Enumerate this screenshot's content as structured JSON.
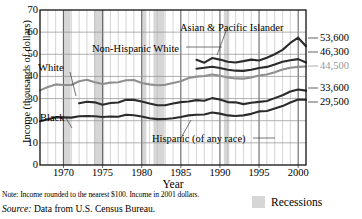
{
  "chart_data": {
    "type": "line",
    "title": "",
    "xlabel": "Year",
    "ylabel": "Income (thousands of dollars)",
    "xlim": [
      1967,
      2001
    ],
    "ylim": [
      0,
      70
    ],
    "yticks": [
      0,
      10,
      20,
      30,
      40,
      50,
      60,
      70
    ],
    "xticks": [
      1970,
      1975,
      1980,
      1985,
      1990,
      1995,
      2000
    ],
    "grid": true,
    "legend_position": "inline-annotations",
    "x": [
      1967,
      1968,
      1969,
      1970,
      1971,
      1972,
      1973,
      1974,
      1975,
      1976,
      1977,
      1978,
      1979,
      1980,
      1981,
      1982,
      1983,
      1984,
      1985,
      1986,
      1987,
      1988,
      1989,
      1990,
      1991,
      1992,
      1993,
      1994,
      1995,
      1996,
      1997,
      1998,
      1999,
      2000,
      2001
    ],
    "series": [
      {
        "name": "Asian & Pacific Islander",
        "color": "#2b2b2b",
        "values": [
          null,
          null,
          null,
          null,
          null,
          null,
          null,
          null,
          null,
          null,
          null,
          null,
          null,
          null,
          null,
          null,
          null,
          null,
          null,
          null,
          47.5,
          46.2,
          48.3,
          47.6,
          46.6,
          46.3,
          46.9,
          47.6,
          47.2,
          48.4,
          50.0,
          52.0,
          55.1,
          57.5,
          53.6
        ]
      },
      {
        "name": "Non-Hispanic White",
        "color": "#2b2b2b",
        "values": [
          null,
          null,
          null,
          null,
          null,
          null,
          null,
          null,
          null,
          null,
          null,
          null,
          null,
          null,
          null,
          null,
          null,
          null,
          null,
          null,
          43.5,
          43.9,
          44.4,
          43.8,
          43.0,
          42.6,
          42.5,
          43.0,
          43.8,
          44.3,
          45.4,
          46.6,
          47.3,
          47.8,
          46.3
        ]
      },
      {
        "name": "White",
        "color": "#8f8f8f",
        "values": [
          33.7,
          35.2,
          36.4,
          36.1,
          36.1,
          37.8,
          38.5,
          37.4,
          36.6,
          37.2,
          37.4,
          38.3,
          38.4,
          37.0,
          36.4,
          36.0,
          36.2,
          37.0,
          37.8,
          39.3,
          39.9,
          40.2,
          40.9,
          40.3,
          39.5,
          39.1,
          39.0,
          39.5,
          40.4,
          40.9,
          41.9,
          43.1,
          43.9,
          44.3,
          44.5
        ]
      },
      {
        "name": "Hispanic (of any race)",
        "color": "#2b2b2b",
        "values": [
          null,
          null,
          null,
          null,
          null,
          27.9,
          28.6,
          28.3,
          27.2,
          28.0,
          28.2,
          29.5,
          29.4,
          28.7,
          27.8,
          27.0,
          27.0,
          27.8,
          28.4,
          28.7,
          29.3,
          29.0,
          30.2,
          29.6,
          28.4,
          28.3,
          27.5,
          28.1,
          28.5,
          28.9,
          30.2,
          31.5,
          33.2,
          34.1,
          33.6
        ]
      },
      {
        "name": "Black",
        "color": "#2b2b2b",
        "values": [
          19.8,
          20.7,
          21.6,
          21.5,
          21.4,
          22.0,
          22.1,
          22.0,
          21.7,
          21.9,
          21.8,
          22.7,
          22.5,
          21.9,
          21.1,
          20.7,
          20.8,
          21.1,
          21.7,
          22.4,
          22.7,
          22.8,
          23.7,
          23.2,
          22.4,
          22.1,
          22.4,
          23.1,
          24.2,
          24.4,
          25.5,
          26.6,
          28.2,
          29.6,
          29.5
        ]
      }
    ],
    "end_labels": [
      {
        "name": "asian-pacific-islander",
        "value": "53,600",
        "gray": false,
        "top": 32
      },
      {
        "name": "non-hispanic-white",
        "value": "46,300",
        "gray": false,
        "top": 46
      },
      {
        "name": "white",
        "value": "44,500",
        "gray": true,
        "top": 60
      },
      {
        "name": "hispanic",
        "value": "33,600",
        "gray": false,
        "top": 82
      },
      {
        "name": "black",
        "value": "29,500",
        "gray": false,
        "top": 96
      }
    ],
    "annotations": [
      {
        "name": "white",
        "text": "White",
        "left": 38,
        "top": 62
      },
      {
        "name": "non-hispanic-white",
        "text": "Non-Hispanic White",
        "left": 92,
        "top": 43
      },
      {
        "name": "asian-pacific-islander",
        "text": "Asian & Pacific Islander",
        "left": 180,
        "top": 22
      },
      {
        "name": "black",
        "text": "Black",
        "left": 40,
        "top": 112
      },
      {
        "name": "hispanic",
        "text": "Hispanic (of any race)",
        "left": 152,
        "top": 133
      }
    ],
    "recessions": [
      {
        "start": 1969.9,
        "end": 1970.9
      },
      {
        "start": 1973.9,
        "end": 1975.2
      },
      {
        "start": 1980.0,
        "end": 1980.6
      },
      {
        "start": 1981.5,
        "end": 1982.9
      },
      {
        "start": 1990.5,
        "end": 1991.2
      },
      {
        "start": 2001.2,
        "end": 2001.9
      }
    ]
  },
  "axes": {
    "y_title": "Income (thousands of dollars)",
    "x_title": "Year",
    "y_ticks": [
      "70",
      "60",
      "50",
      "40",
      "30",
      "20",
      "10",
      "0"
    ],
    "x_ticks": [
      "1970",
      "1975",
      "1980",
      "1985",
      "1990",
      "1995",
      "2000"
    ]
  },
  "legend": {
    "recessions_label": "Recessions",
    "recessions_color": "#d6d6d6"
  },
  "footnotes": {
    "note": "Note: Income rounded to the nearest $100. Income in 2001 dollars.",
    "source_prefix": "Source:",
    "source_text": "Data from U.S. Census Bureau."
  }
}
